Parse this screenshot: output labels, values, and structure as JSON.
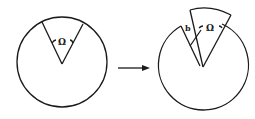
{
  "diagram": {
    "type": "geometric-transformation",
    "colors": {
      "stroke": "#1a1a1a",
      "background": "#ffffff"
    },
    "left_figure": {
      "angle_label": "Ω"
    },
    "arrow": {
      "direction": "right"
    },
    "right_figure": {
      "angle_label": "Ω",
      "displacement_label": "b"
    }
  }
}
